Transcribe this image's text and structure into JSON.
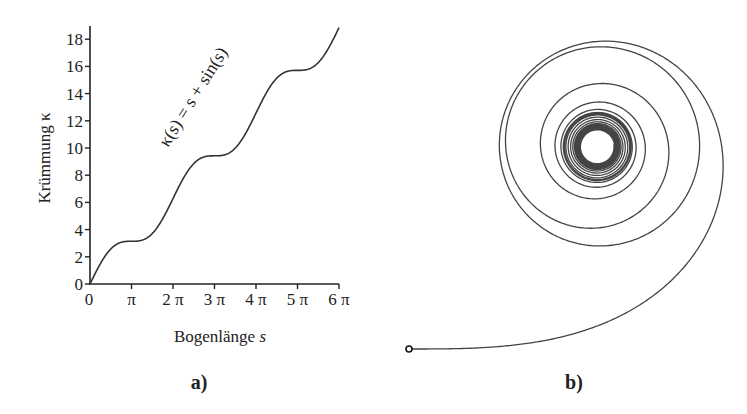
{
  "panel_a": {
    "label": "a)",
    "ylabel": "Krümmung κ",
    "xlabel": "Bogenlänge s",
    "yticks": [
      "0",
      "2",
      "4",
      "6",
      "8",
      "10",
      "12",
      "14",
      "16",
      "18"
    ],
    "xticks": [
      "0",
      "π",
      "2 π",
      "3 π",
      "4 π",
      "5 π",
      "6 π"
    ],
    "annotation": "κ(s) = s + sin(s)"
  },
  "panel_b": {
    "label": "b)",
    "description": "Planar curve with curvature κ(s) = s + sin(s), starting at marked point"
  },
  "chart_data": [
    {
      "type": "line",
      "title": "",
      "xlabel": "Bogenlänge s",
      "ylabel": "Krümmung κ",
      "x_ticks": [
        "0",
        "π",
        "2π",
        "3π",
        "4π",
        "5π",
        "6π"
      ],
      "y_ticks": [
        0,
        2,
        4,
        6,
        8,
        10,
        12,
        14,
        16,
        18
      ],
      "xlim": [
        0,
        18.85
      ],
      "ylim": [
        0,
        18.85
      ],
      "series": [
        {
          "name": "κ(s) = s + sin(s)",
          "x": [
            0,
            1.571,
            3.142,
            4.712,
            6.283,
            7.854,
            9.425,
            10.996,
            12.566,
            14.137,
            15.708,
            17.279,
            18.85
          ],
          "values": [
            0,
            2.571,
            3.142,
            3.712,
            6.283,
            8.854,
            9.425,
            9.996,
            12.566,
            15.137,
            15.708,
            16.279,
            18.85
          ]
        }
      ],
      "grid": false,
      "legend": "none"
    }
  ]
}
